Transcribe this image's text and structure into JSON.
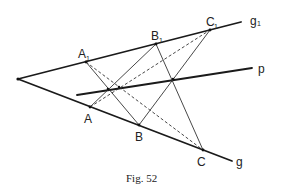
{
  "figure": {
    "caption": "Fig. 52",
    "lines": {
      "g": "g",
      "g1": "g",
      "g1_sub": "1",
      "p": "p"
    },
    "points": {
      "A": "A",
      "B": "B",
      "C": "C",
      "A1": "A",
      "B1": "B",
      "C1": "C",
      "sub": "1"
    },
    "colors": {
      "line": "#1a1a1a",
      "background": "#ffffff"
    }
  }
}
